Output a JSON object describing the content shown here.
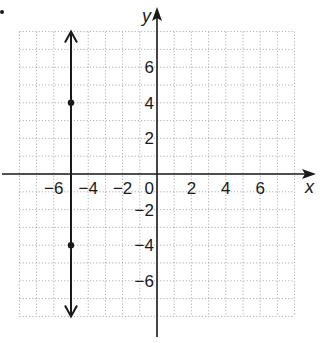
{
  "chart_data": {
    "type": "line",
    "title": "",
    "xlabel": "x",
    "ylabel": "y",
    "xlim": [
      -8,
      8
    ],
    "ylim": [
      -8,
      8
    ],
    "grid": true,
    "grid_step": 1,
    "x_ticks": [
      -6,
      -4,
      -2,
      0,
      2,
      4,
      6
    ],
    "x_tick_labels": [
      "−6",
      "−4",
      "−2",
      "0",
      "2",
      "4",
      "6"
    ],
    "y_ticks": [
      -6,
      -4,
      -2,
      2,
      4,
      6
    ],
    "y_tick_labels": [
      "−6",
      "−4",
      "−2",
      "2",
      "4",
      "6"
    ],
    "series": [
      {
        "name": "x = -5",
        "kind": "vertical-line",
        "x": -5,
        "y_range": [
          -8,
          8
        ],
        "arrows": "both",
        "points": [
          {
            "x": -5,
            "y": 4
          },
          {
            "x": -5,
            "y": -4
          }
        ]
      }
    ],
    "colors": {
      "line": "#1a1a1a",
      "grid": "#9a9a9a"
    }
  }
}
